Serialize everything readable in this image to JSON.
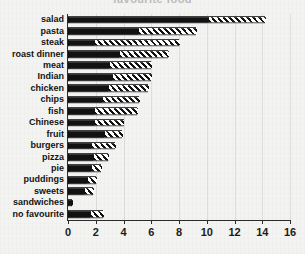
{
  "chart_data": {
    "type": "bar",
    "orientation": "horizontal",
    "stacked": true,
    "title": "favourite food",
    "xlabel": "",
    "ylabel": "",
    "xlim": [
      0,
      16
    ],
    "xticks": [
      0,
      2,
      4,
      6,
      8,
      10,
      12,
      14,
      16
    ],
    "xticklabels": [
      "0",
      "2",
      "4",
      "6",
      "8",
      "10",
      "12",
      "14",
      "16"
    ],
    "grid": true,
    "legend": "none",
    "categories": [
      "salad",
      "pasta",
      "steak",
      "roast dinner",
      "meat",
      "Indian",
      "chicken",
      "chips",
      "fish",
      "Chinese",
      "fruit",
      "burgers",
      "pizza",
      "pie",
      "puddings",
      "sweets",
      "sandwiches",
      "no favourite"
    ],
    "series": [
      {
        "name": "solid",
        "fill": "solid-black",
        "values": [
          10.0,
          5.0,
          1.8,
          3.6,
          2.9,
          3.1,
          2.8,
          2.4,
          1.8,
          1.8,
          2.5,
          1.6,
          1.7,
          1.6,
          1.3,
          1.1,
          0.3,
          1.5
        ]
      },
      {
        "name": "hatched",
        "fill": "diagonal-hatch",
        "values": [
          4.2,
          4.2,
          6.2,
          3.6,
          3.1,
          2.9,
          3.0,
          2.7,
          3.2,
          2.2,
          1.4,
          1.8,
          1.2,
          0.8,
          0.7,
          0.7,
          0.0,
          1.0
        ]
      }
    ],
    "totals": [
      14.2,
      9.2,
      8.0,
      7.2,
      6.0,
      6.0,
      5.8,
      5.1,
      5.0,
      4.0,
      3.9,
      3.4,
      2.9,
      2.4,
      2.0,
      1.8,
      0.3,
      2.5
    ],
    "colors": {
      "solid": "#121212",
      "hatch_line": "#111111",
      "hatch_background": "#ffffff",
      "axis": "#2b2b2b",
      "grid": "#e2e2e2",
      "background": "#f3f3f1",
      "text": "#141414"
    }
  }
}
